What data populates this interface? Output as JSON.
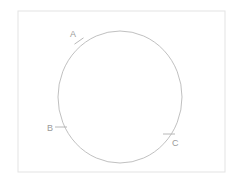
{
  "figure": {
    "background_color": "#ffffff",
    "frame": {
      "name": "diagram-border",
      "x": 18,
      "y": 11,
      "width": 207,
      "height": 161,
      "stroke_color": "#e3e3e3",
      "fill_color": "#ffffff"
    },
    "circle": {
      "name": "circle",
      "center_x": 120,
      "center_y": 97,
      "radius_x": 62,
      "radius_y": 66,
      "stroke_color": "#b9b9b9",
      "fill": "none"
    },
    "points": [
      {
        "id": "A",
        "label": "A",
        "label_x": 70,
        "label_y": 37,
        "tick_x": 79,
        "tick_y": 41,
        "tick_angle": -35,
        "tick_length": 11,
        "color": "#9a9a9a"
      },
      {
        "id": "B",
        "label": "B",
        "label_x": 47,
        "label_y": 131,
        "tick_x": 61,
        "tick_y": 127,
        "tick_angle": 0,
        "tick_length": 12,
        "color": "#9a9a9a"
      },
      {
        "id": "C",
        "label": "C",
        "label_x": 172,
        "label_y": 146,
        "tick_x": 169,
        "tick_y": 134,
        "tick_angle": 0,
        "tick_length": 12,
        "color": "#9a9a9a"
      }
    ]
  }
}
